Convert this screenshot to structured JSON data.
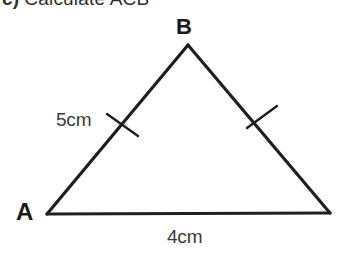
{
  "question": {
    "number_label": "c)",
    "prompt": "Calculate ACB"
  },
  "figure": {
    "kind": "triangle",
    "vertices": [
      {
        "name": "A",
        "label": "A",
        "x": 47,
        "y": 214
      },
      {
        "name": "B",
        "label": "B",
        "x": 188,
        "y": 45
      },
      {
        "name": "C",
        "label": "",
        "x": 330,
        "y": 213
      }
    ],
    "sides": [
      {
        "name": "AB",
        "length_label": "5cm",
        "tick_marks": 1
      },
      {
        "name": "BC",
        "length_label": "",
        "tick_marks": 1
      },
      {
        "name": "AC",
        "length_label": "4cm",
        "tick_marks": 0
      }
    ],
    "labels": {
      "vertex_a": "A",
      "vertex_b": "B",
      "side_ab": "5cm",
      "side_ac": "4cm"
    },
    "colors": {
      "stroke": "#1f1f1f",
      "background": "#ffffff",
      "text": "#1a1a1a",
      "measure_text": "#3a3a3a"
    },
    "stroke_width": 3
  }
}
